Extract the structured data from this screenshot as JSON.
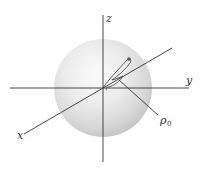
{
  "figure": {
    "axes": {
      "x_label": "x",
      "y_label": "y",
      "z_label": "z"
    },
    "annotation": {
      "symbol": "ρ",
      "subscript": "0"
    },
    "colors": {
      "sphere_highlight": "#fafafa",
      "sphere_mid": "#e6e6e6",
      "sphere_edge": "#c4c4c4",
      "line": "#333333"
    }
  }
}
